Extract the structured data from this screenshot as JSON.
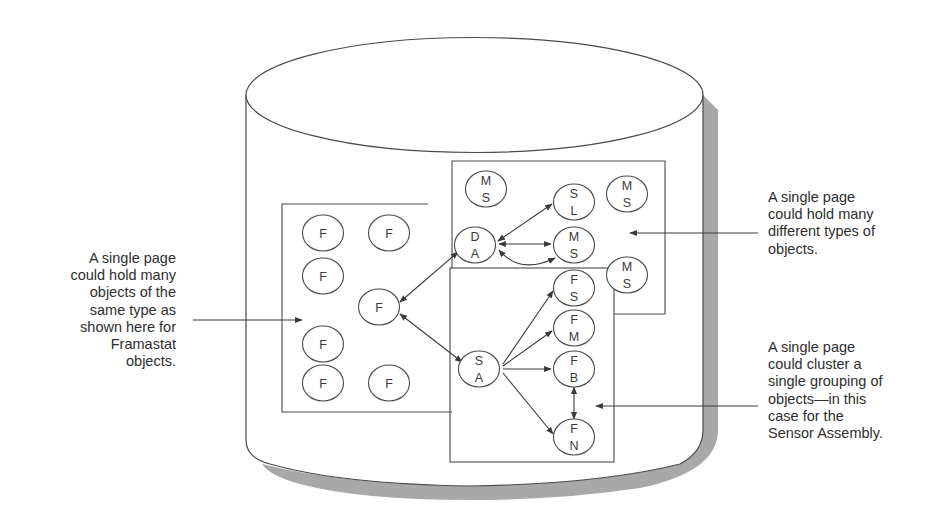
{
  "diagram": {
    "type": "database-page-clustering",
    "container": "database-cylinder",
    "pages": [
      {
        "id": "page-same-type",
        "nodes": [
          {
            "id": "f1",
            "lines": [
              "F"
            ],
            "x": 323,
            "y": 233
          },
          {
            "id": "f2",
            "lines": [
              "F"
            ],
            "x": 389,
            "y": 233
          },
          {
            "id": "f3",
            "lines": [
              "F"
            ],
            "x": 323,
            "y": 276
          },
          {
            "id": "f-hub",
            "lines": [
              "F"
            ],
            "x": 379,
            "y": 307
          },
          {
            "id": "f4",
            "lines": [
              "F"
            ],
            "x": 323,
            "y": 344
          },
          {
            "id": "f5",
            "lines": [
              "F"
            ],
            "x": 323,
            "y": 383
          },
          {
            "id": "f6",
            "lines": [
              "F"
            ],
            "x": 389,
            "y": 383
          }
        ]
      },
      {
        "id": "page-different-types",
        "nodes": [
          {
            "id": "ms1",
            "lines": [
              "M",
              "S"
            ],
            "x": 486,
            "y": 189
          },
          {
            "id": "sl",
            "lines": [
              "S",
              "L"
            ],
            "x": 574,
            "y": 202
          },
          {
            "id": "ms2",
            "lines": [
              "M",
              "S"
            ],
            "x": 627,
            "y": 194
          },
          {
            "id": "da",
            "lines": [
              "D",
              "A"
            ],
            "x": 475,
            "y": 245
          },
          {
            "id": "ms3",
            "lines": [
              "M",
              "S"
            ],
            "x": 574,
            "y": 245
          },
          {
            "id": "ms4",
            "lines": [
              "M",
              "S"
            ],
            "x": 627,
            "y": 275
          }
        ]
      },
      {
        "id": "page-sensor-assembly",
        "nodes": [
          {
            "id": "fs",
            "lines": [
              "F",
              "S"
            ],
            "x": 574,
            "y": 288
          },
          {
            "id": "fm",
            "lines": [
              "F",
              "M"
            ],
            "x": 574,
            "y": 328
          },
          {
            "id": "sa",
            "lines": [
              "S",
              "A"
            ],
            "x": 479,
            "y": 369
          },
          {
            "id": "fb",
            "lines": [
              "F",
              "B"
            ],
            "x": 574,
            "y": 369
          },
          {
            "id": "fn",
            "lines": [
              "F",
              "N"
            ],
            "x": 574,
            "y": 437
          }
        ]
      }
    ],
    "connections": [
      {
        "from": "f-hub",
        "to": "da",
        "bidirectional": true
      },
      {
        "from": "f-hub",
        "to": "sa",
        "bidirectional": true
      },
      {
        "from": "da",
        "to": "sl",
        "bidirectional": true
      },
      {
        "from": "da",
        "to": "ms3",
        "bidirectional": true
      },
      {
        "from": "da",
        "to": "ms3",
        "bidirectional": true,
        "curved": true
      },
      {
        "from": "sa",
        "to": "fs"
      },
      {
        "from": "sa",
        "to": "fm"
      },
      {
        "from": "sa",
        "to": "fb"
      },
      {
        "from": "sa",
        "to": "fn"
      },
      {
        "from": "fb",
        "to": "fn",
        "bidirectional": true
      }
    ]
  },
  "callouts": {
    "left": {
      "lines": [
        "A single page",
        "could hold many",
        "objects of the",
        "same type as",
        "shown here for",
        "Framastat",
        "objects."
      ]
    },
    "right_top": {
      "lines": [
        "A single page",
        "could hold many",
        "different types of",
        "objects."
      ]
    },
    "right_bottom": {
      "lines": [
        "A single page",
        "could cluster a",
        "single grouping of",
        "objects—in this",
        "case for the",
        "Sensor Assembly."
      ]
    }
  },
  "colors": {
    "line": "#4a4a4a",
    "shadow": "#a8a8a8",
    "text": "#2e2e2e",
    "background": "#ffffff"
  }
}
